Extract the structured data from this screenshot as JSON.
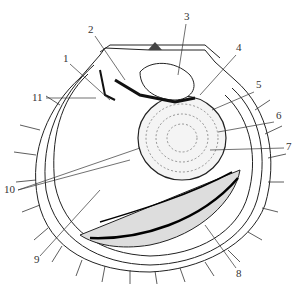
{
  "diagram": {
    "type": "anatomical line drawing",
    "labels": [
      {
        "id": "1",
        "text": "1",
        "x": 63,
        "y": 62
      },
      {
        "id": "2",
        "text": "2",
        "x": 88,
        "y": 33
      },
      {
        "id": "3",
        "text": "3",
        "x": 184,
        "y": 20
      },
      {
        "id": "4",
        "text": "4",
        "x": 236,
        "y": 51
      },
      {
        "id": "5",
        "text": "5",
        "x": 256,
        "y": 88
      },
      {
        "id": "6",
        "text": "6",
        "x": 276,
        "y": 119
      },
      {
        "id": "7",
        "text": "7",
        "x": 286,
        "y": 150
      },
      {
        "id": "8",
        "text": "8",
        "x": 236,
        "y": 277
      },
      {
        "id": "9",
        "text": "9",
        "x": 34,
        "y": 263
      },
      {
        "id": "10",
        "text": "10",
        "x": 4,
        "y": 193
      },
      {
        "id": "11",
        "text": "11",
        "x": 32,
        "y": 101
      }
    ],
    "colors": {
      "ink": "#222222",
      "background": "#ffffff"
    }
  }
}
